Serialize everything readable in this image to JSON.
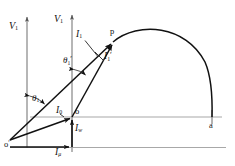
{
  "figure": {
    "type": "phasor-diagram",
    "background": "#ffffff",
    "line_color": "#111111",
    "axis_color": "#9a9a9a",
    "width": 235,
    "height": 166
  },
  "axes": {
    "left_vertical": {
      "label": "V",
      "sub": "1",
      "x": 27,
      "y_top": 14,
      "y_bottom": 148,
      "arrow": "up"
    },
    "right_vertical": {
      "label": "V",
      "sub": "1",
      "x": 72,
      "y_top": 12,
      "y_bottom": 152,
      "arrow": "up"
    },
    "baseline_lower": {
      "y": 147,
      "x_start": 10,
      "x_end": 225
    },
    "baseline_upper": {
      "y": 117,
      "x_start": 30,
      "x_end": 222
    }
  },
  "origins": {
    "o_prime": {
      "label": "o",
      "prime": "′",
      "x": 10,
      "y": 140
    },
    "o": {
      "label": "o",
      "x": 72,
      "y": 117
    }
  },
  "points": {
    "p": {
      "label": "p",
      "x": 113,
      "y": 42
    },
    "a": {
      "label": "a",
      "x": 212,
      "y": 117
    }
  },
  "arc": {
    "description": "semicircular locus from p to a",
    "from": "p",
    "to": "a",
    "apex_x": 165,
    "apex_y": 30
  },
  "vectors": [
    {
      "name": "I1",
      "label": "I",
      "sub": "1",
      "prime": "",
      "from": "o_prime",
      "to": "p"
    },
    {
      "name": "I1p",
      "label": "I",
      "sub": "1",
      "prime": "′",
      "from": "o",
      "to": "p"
    },
    {
      "name": "I0",
      "label": "I",
      "sub": "0",
      "prime": "",
      "from": "o_prime",
      "to": "o"
    },
    {
      "name": "Iw",
      "label": "I",
      "sub": "w",
      "prime": "",
      "from": "baseline",
      "to": "o"
    },
    {
      "name": "Imu",
      "label": "I",
      "sub": "μ",
      "prime": "",
      "from": "o_prime",
      "to": "foot"
    }
  ],
  "labels": {
    "v1_left": {
      "text": "V",
      "sub": "1"
    },
    "v1_right": {
      "text": "V",
      "sub": "1"
    },
    "i1": {
      "text": "I",
      "sub": "1",
      "prime": ""
    },
    "i1_prime": {
      "text": "I",
      "sub": "1",
      "prime": "′"
    },
    "i0": {
      "text": "I",
      "sub": "0"
    },
    "iw": {
      "text": "I",
      "sub": "w"
    },
    "imu": {
      "text": "I",
      "sub": "μ"
    },
    "theta1": {
      "text": "θ",
      "sub": "1",
      "prime": ""
    },
    "theta1_prime": {
      "text": "θ",
      "sub": "1",
      "prime": "′"
    },
    "point_p": {
      "text": "p"
    },
    "point_a": {
      "text": "a"
    },
    "origin_o": {
      "text": "o"
    },
    "origin_o_prime": {
      "text": "o",
      "prime": "′"
    }
  },
  "angles": {
    "theta1": {
      "vertex": "o_prime",
      "between": [
        "V1-left-axis",
        "I1"
      ]
    },
    "theta1_prime": {
      "vertex": "o",
      "between": [
        "V1-right-axis",
        "I1-prime"
      ]
    }
  }
}
